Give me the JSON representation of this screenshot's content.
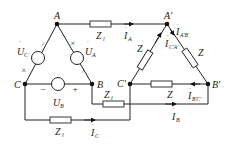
{
  "diagram": {
    "type": "three-phase circuit: delta-connected source to delta-connected load via line impedances",
    "nodes": {
      "A": {
        "label": "A"
      },
      "B": {
        "label": "B"
      },
      "C": {
        "label": "C"
      },
      "A_prime": {
        "label": "A′"
      },
      "B_prime": {
        "label": "B′"
      },
      "C_prime": {
        "label": "C′"
      }
    },
    "sources": [
      {
        "id": "UA",
        "symbol": "U",
        "sub": "A",
        "polarity": "× near A"
      },
      {
        "id": "UB",
        "symbol": "U",
        "sub": "B",
        "minus": "−",
        "plus": "+"
      },
      {
        "id": "UC",
        "symbol": "U",
        "sub": "C",
        "polarity": "× near C"
      }
    ],
    "marks": {
      "cross": "×",
      "tick": "/"
    },
    "line_impedances": [
      {
        "id": "ZlA",
        "symbol": "Z",
        "sub": "l"
      },
      {
        "id": "ZlB",
        "symbol": "Z",
        "sub": "l"
      },
      {
        "id": "ZlC",
        "symbol": "Z",
        "sub": "l"
      }
    ],
    "load_impedances": [
      {
        "id": "ZAB",
        "symbol": "Z"
      },
      {
        "id": "ZBC",
        "symbol": "Z"
      },
      {
        "id": "ZCA",
        "symbol": "Z"
      }
    ],
    "currents": [
      {
        "id": "IA",
        "symbol": "I",
        "sub": "A"
      },
      {
        "id": "IB",
        "symbol": "I",
        "sub": "B"
      },
      {
        "id": "IC",
        "symbol": "I",
        "sub": "C"
      },
      {
        "id": "IAB",
        "symbol": "I",
        "sub": "A′B′"
      },
      {
        "id": "IBC",
        "symbol": "I",
        "sub": "B′C′"
      },
      {
        "id": "ICA",
        "symbol": "I",
        "sub": "C′A′"
      }
    ],
    "dot": "·"
  }
}
